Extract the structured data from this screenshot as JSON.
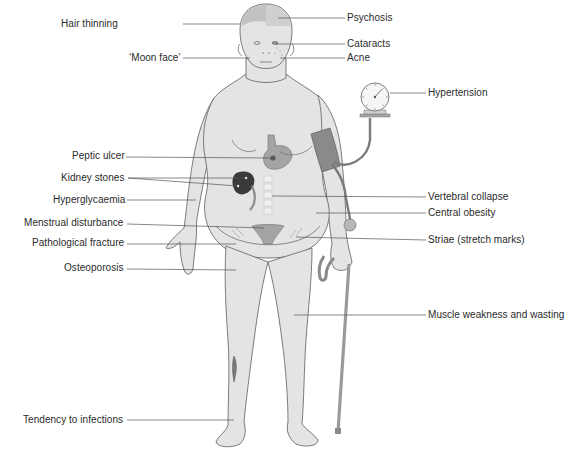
{
  "diagram": {
    "colors": {
      "skin": "#e4e4e4",
      "outline": "#6e6e6e",
      "organ": "#a4a4a4",
      "kidney": "#3a3a3a",
      "cuff": "#8a8a8a",
      "leader": "#555555",
      "text": "#2a2a2a"
    },
    "labels_left": [
      {
        "id": "hair-thinning",
        "text": "Hair thinning",
        "x": 125,
        "y": 18
      },
      {
        "id": "moon-face",
        "text": "‘Moon face’",
        "x": 129,
        "y": 52
      },
      {
        "id": "peptic-ulcer",
        "text": "Peptic ulcer",
        "x": 72,
        "y": 150
      },
      {
        "id": "kidney-stones",
        "text": "Kidney stones",
        "x": 61,
        "y": 172
      },
      {
        "id": "hyperglycaemia",
        "text": "Hyperglycaemia",
        "x": 53,
        "y": 194
      },
      {
        "id": "menstrual-disturbance",
        "text": "Menstrual disturbance",
        "x": 24,
        "y": 217
      },
      {
        "id": "pathological-fracture",
        "text": "Pathological fracture",
        "x": 32,
        "y": 237
      },
      {
        "id": "osteoporosis",
        "text": "Osteoporosis",
        "x": 64,
        "y": 262
      },
      {
        "id": "tendency-to-infections",
        "text": "Tendency to infections",
        "x": 23,
        "y": 414
      }
    ],
    "labels_right": [
      {
        "id": "psychosis",
        "text": "Psychosis",
        "x": 347,
        "y": 11
      },
      {
        "id": "cataracts",
        "text": "Cataracts",
        "x": 347,
        "y": 37
      },
      {
        "id": "acne",
        "text": "Acne",
        "x": 347,
        "y": 52
      },
      {
        "id": "hypertension",
        "text": "Hypertension",
        "x": 428,
        "y": 86
      },
      {
        "id": "vertebral-collapse",
        "text": "Vertebral collapse",
        "x": 428,
        "y": 190
      },
      {
        "id": "central-obesity",
        "text": "Central obesity",
        "x": 428,
        "y": 206
      },
      {
        "id": "striae",
        "text": "Striae (stretch marks)",
        "x": 428,
        "y": 233
      },
      {
        "id": "muscle-weakness",
        "text": "Muscle weakness and wasting",
        "x": 428,
        "y": 309
      }
    ]
  }
}
